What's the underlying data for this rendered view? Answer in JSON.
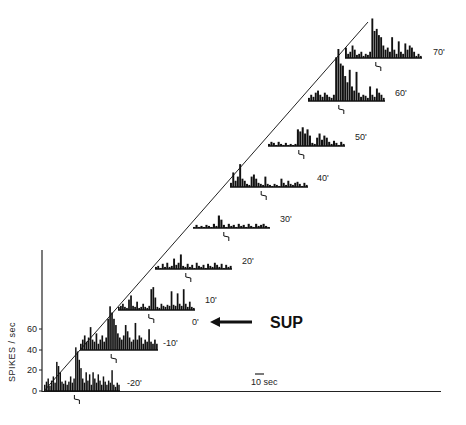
{
  "chart_data": {
    "type": "bar",
    "title": "",
    "subtitle": "Stacked peri-stimulus spike-rate histograms over time (waterfall plot)",
    "ylabel": "SPIKES / sec",
    "xlabel": "",
    "yticks": [
      0,
      20,
      40,
      60
    ],
    "ylim": [
      0,
      130
    ],
    "grid": false,
    "scale_bar": "10 sec",
    "annotation": {
      "text": "SUP",
      "arrow": "left",
      "points_to": "0'"
    },
    "series": [
      {
        "name": "-20'",
        "baseline_y": 391,
        "x_start": 44,
        "width": 76,
        "values": [
          6,
          9,
          12,
          5,
          10,
          14,
          8,
          28,
          24,
          18,
          9,
          7,
          10,
          6,
          9,
          14,
          8,
          12,
          42,
          38,
          30,
          22,
          12,
          8,
          18,
          10,
          16,
          6,
          18,
          12,
          8,
          16,
          10,
          6,
          14,
          9,
          6,
          10,
          8,
          20,
          6,
          4,
          8,
          6
        ]
      },
      {
        "name": "-10'",
        "baseline_y": 350,
        "x_start": 80,
        "width": 78,
        "values": [
          6,
          10,
          14,
          8,
          12,
          22,
          10,
          8,
          16,
          6,
          10,
          14,
          8,
          12,
          30,
          42,
          36,
          30,
          24,
          16,
          12,
          10,
          14,
          24,
          18,
          12,
          8,
          10,
          26,
          10,
          14,
          12,
          6,
          10,
          8,
          20,
          8,
          6,
          10,
          6
        ]
      },
      {
        "name": "0'",
        "baseline_y": null,
        "values": []
      },
      {
        "name": "10'",
        "baseline_y": 310,
        "x_start": 118,
        "width": 77,
        "values": [
          3,
          4,
          6,
          3,
          2,
          10,
          14,
          4,
          3,
          8,
          2,
          3,
          6,
          3,
          2,
          4,
          20,
          22,
          12,
          3,
          2,
          6,
          4,
          3,
          5,
          4,
          18,
          5,
          4,
          16,
          6,
          4,
          20,
          6,
          3,
          8,
          3,
          2
        ]
      },
      {
        "name": "20'",
        "baseline_y": 269,
        "x_start": 155,
        "width": 77,
        "values": [
          2,
          3,
          1,
          5,
          2,
          6,
          2,
          3,
          10,
          4,
          6,
          14,
          3,
          2,
          5,
          2,
          4,
          1,
          6,
          3,
          2,
          4,
          1,
          5,
          3,
          2,
          6,
          4,
          2,
          5,
          1,
          4,
          2,
          3
        ]
      },
      {
        "name": "30'",
        "baseline_y": 228,
        "x_start": 193,
        "width": 77,
        "values": [
          1,
          3,
          1,
          2,
          1,
          3,
          2,
          1,
          4,
          2,
          12,
          8,
          3,
          1,
          4,
          2,
          3,
          1,
          4,
          2,
          3,
          1,
          4,
          2,
          1,
          4,
          2,
          3,
          4,
          2,
          1
        ]
      },
      {
        "name": "40'",
        "baseline_y": 187,
        "x_start": 230,
        "width": 78,
        "values": [
          4,
          14,
          6,
          10,
          22,
          8,
          6,
          3,
          2,
          10,
          12,
          8,
          4,
          3,
          2,
          10,
          3,
          2,
          1,
          3,
          2,
          1,
          8,
          4,
          2,
          6,
          3,
          2,
          4,
          5,
          3,
          1,
          4,
          2
        ]
      },
      {
        "name": "50'",
        "baseline_y": 146,
        "x_start": 268,
        "width": 77,
        "values": [
          2,
          4,
          3,
          1,
          4,
          2,
          1,
          3,
          1,
          2,
          1,
          2,
          16,
          14,
          18,
          12,
          16,
          10,
          3,
          2,
          8,
          12,
          6,
          10,
          8,
          4,
          2,
          5,
          3,
          1,
          4,
          2
        ]
      },
      {
        "name": "60'",
        "baseline_y": 101,
        "x_start": 308,
        "width": 77,
        "values": [
          3,
          6,
          4,
          8,
          10,
          6,
          4,
          8,
          6,
          4,
          3,
          6,
          42,
          50,
          36,
          34,
          24,
          18,
          30,
          14,
          10,
          28,
          8,
          4,
          6,
          5,
          3,
          14,
          6,
          4,
          12,
          8,
          6,
          3
        ]
      },
      {
        "name": "70'",
        "baseline_y": 58,
        "x_start": 345,
        "width": 77,
        "values": [
          10,
          4,
          6,
          12,
          8,
          3,
          4,
          6,
          2,
          4,
          3,
          6,
          38,
          26,
          28,
          22,
          20,
          12,
          8,
          10,
          6,
          20,
          8,
          4,
          16,
          6,
          4,
          14,
          8,
          12,
          10,
          6,
          2,
          4,
          2
        ]
      }
    ]
  },
  "labels": {
    "y_axis": "SPIKES / sec",
    "ticks": [
      "0",
      "20",
      "40",
      "60"
    ],
    "scale_bar": "10 sec",
    "sup": "SUP",
    "rows": [
      "-20'",
      "-10'",
      "0'",
      "10'",
      "20'",
      "30'",
      "40'",
      "50'",
      "60'",
      "70'"
    ]
  }
}
